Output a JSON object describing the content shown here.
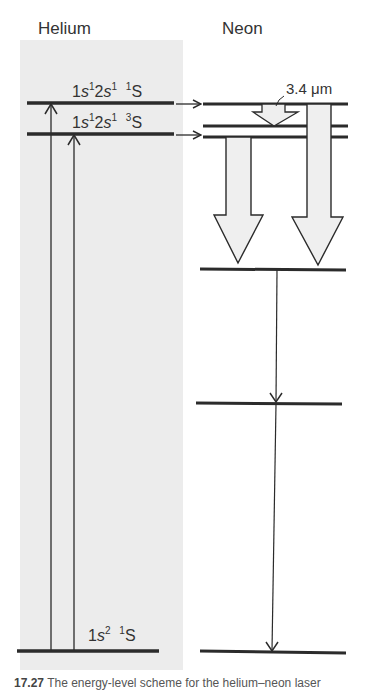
{
  "figure": {
    "left_column_title": "Helium",
    "right_column_title": "Neon",
    "panel_color": "#ececec",
    "line_color": "#2b2b2b",
    "arrow_fill": "#efefef"
  },
  "helium_levels": [
    {
      "id": "he-1s2s-singlet",
      "label_config": "1s¹2s¹",
      "label_term": "¹S",
      "label": "1s12s1 1S",
      "y": 103
    },
    {
      "id": "he-1s2s-triplet",
      "label_config": "1s¹2s¹",
      "label_term": "³S",
      "label": "1s12s1 3S",
      "y": 134
    },
    {
      "id": "he-ground",
      "label_config": "1s²",
      "label_term": "¹S",
      "label": "1s2 1S",
      "y": 651
    }
  ],
  "helium_excitations": [
    {
      "from": "he-ground",
      "to": "he-1s2s-singlet",
      "x": 51
    },
    {
      "from": "he-ground",
      "to": "he-1s2s-triplet",
      "x": 74
    }
  ],
  "transfers": [
    {
      "from": "he-1s2s-singlet",
      "to": "ne-upper-1"
    },
    {
      "from": "he-1s2s-triplet",
      "to": "ne-upper-3"
    }
  ],
  "neon_levels": [
    {
      "id": "ne-upper-1",
      "y": 104
    },
    {
      "id": "ne-upper-2",
      "y": 126
    },
    {
      "id": "ne-upper-3",
      "y": 137
    },
    {
      "id": "ne-lower-1",
      "y": 269
    },
    {
      "id": "ne-lower-2",
      "y": 403
    },
    {
      "id": "ne-ground",
      "y": 652
    }
  ],
  "laser_transitions": [
    {
      "label": "3.4 μm",
      "from": "ne-upper-1",
      "to": "ne-upper-2"
    },
    {
      "label": "1.2 μm",
      "from": "ne-upper-3",
      "to": "ne-lower-1"
    },
    {
      "label": "632.8 nm",
      "from": "ne-upper-1",
      "to": "ne-lower-1"
    }
  ],
  "decays": [
    {
      "from": "ne-lower-1",
      "to": "ne-lower-2"
    },
    {
      "from": "ne-lower-2",
      "to": "ne-ground"
    }
  ],
  "caption": {
    "number": "17.27",
    "text": "The energy-level scheme for the helium–neon laser"
  }
}
